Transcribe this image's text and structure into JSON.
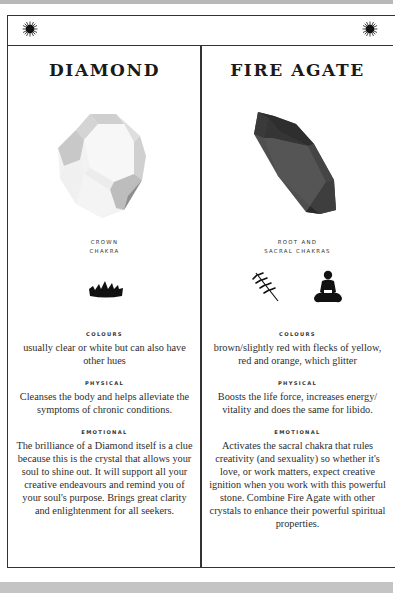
{
  "header": {
    "left_icon": "sun-icon",
    "center_icon": "crescent-moon-icon",
    "right_icon": "sun-icon"
  },
  "crystals": [
    {
      "name": "DIAMOND",
      "gem_icon": "diamond-crystal-image",
      "gem_color": "#d9d9d9",
      "chakra_line1": "CROWN",
      "chakra_line2": "CHAKRA",
      "chakra_icons": [
        "crown-icon"
      ],
      "colours_label": "COLOURS",
      "colours_text": "usually clear or white but can also have other hues",
      "physical_label": "PHYSICAL",
      "physical_text": "Cleanses the body and helps alleviate the symptoms of chronic conditions.",
      "emotional_label": "EMOTIONAL",
      "emotional_text": "The brilliance of a Diamond itself is a clue because this is the crystal that allows your soul to shine out. It will support all your creative endeavours and remind you of your soul's purpose. Brings great clarity and enlightenment for all seekers."
    },
    {
      "name": "FIRE AGATE",
      "gem_icon": "fire-agate-crystal-image",
      "gem_color": "#4a4a4a",
      "chakra_line1": "ROOT AND",
      "chakra_line2": "SACRAL CHAKRAS",
      "chakra_icons": [
        "wheat-sprig-icon",
        "meditating-figure-icon"
      ],
      "colours_label": "COLOURS",
      "colours_text": "brown/slightly red with flecks of yellow, red and orange, which glitter",
      "physical_label": "PHYSICAL",
      "physical_text": "Boosts the life force, increases energy/ vitality and does the same for libido.",
      "emotional_label": "EMOTIONAL",
      "emotional_text": "Activates the sacral chakra that rules creativity (and sexuality) so whether it's love, or work matters, expect creative ignition when you work with this powerful stone. Combine Fire Agate with other crystals to enhance their powerful spiritual properties."
    }
  ]
}
